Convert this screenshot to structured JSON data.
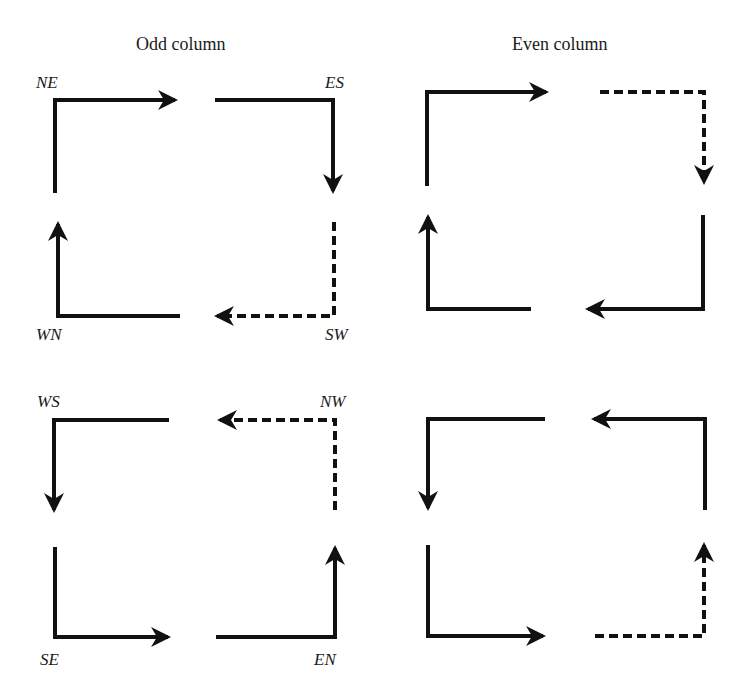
{
  "titles": {
    "odd": "Odd column",
    "even": "Even column"
  },
  "labels": {
    "NE": "NE",
    "ES": "ES",
    "WN": "WN",
    "SW": "SW",
    "WS": "WS",
    "NW": "NW",
    "SE": "SE",
    "EN": "EN"
  },
  "legend": {
    "solid": "solid arrow = turn path",
    "dashed": "dashed arrow = alternate turn path"
  },
  "colors": {
    "stroke": "#111111",
    "background": "#ffffff"
  }
}
